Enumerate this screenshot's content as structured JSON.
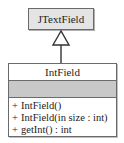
{
  "diagram": {
    "type": "uml-class-generalization",
    "parent": {
      "name": "JTextField",
      "fill": "#e4e4e4"
    },
    "relationship": "generalization",
    "child": {
      "name": "IntField",
      "attributes": [],
      "attributes_fill": "#c8c8c8",
      "operations": [
        {
          "visibility": "+",
          "signature": "IntField()"
        },
        {
          "visibility": "+",
          "signature": "IntField(in size : int)"
        },
        {
          "visibility": "+",
          "signature": "getInt() : int"
        }
      ]
    }
  }
}
